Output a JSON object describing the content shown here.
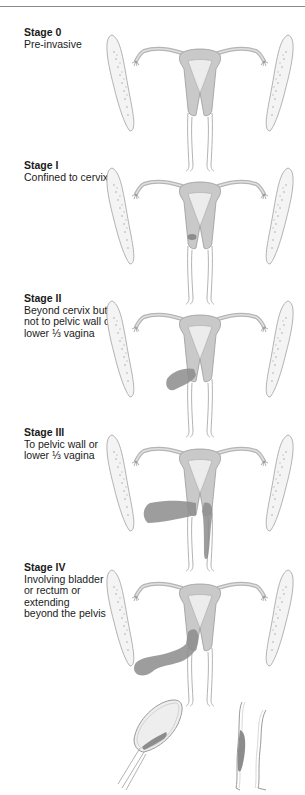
{
  "figure": {
    "type": "Cervical cancer FIGO staging diagram",
    "colors": {
      "tissue_fill": "#c9c9c9",
      "tissue_light": "#e6e6e6",
      "outline": "#9a9a9a",
      "tumor": "#8c8c8c",
      "rule": "#8a8a8a"
    }
  },
  "stages": [
    {
      "title": "Stage 0",
      "description": "Pre-invasive"
    },
    {
      "title": "Stage I",
      "description": "Confined to cervix"
    },
    {
      "title": "Stage II",
      "description": "Beyond cervix but\nnot to pelvic wall or\nlower ⅓ vagina"
    },
    {
      "title": "Stage III",
      "description": "To pelvic wall or\nlower ⅓ vagina"
    },
    {
      "title": "Stage IV",
      "description": "Involving bladder\nor rectum or extending\nbeyond the pelvis"
    }
  ],
  "inset": {
    "organs": [
      "bladder",
      "rectum"
    ]
  }
}
